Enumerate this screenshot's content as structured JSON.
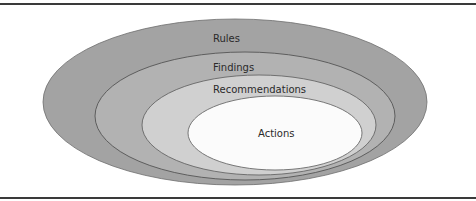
{
  "diagram": {
    "type": "nested-ellipses",
    "layers": [
      {
        "label": "Rules",
        "fill": "#a3a3a3",
        "stroke": "#6e6e6e"
      },
      {
        "label": "Findings",
        "fill": "#b2b2b2",
        "stroke": "#555555"
      },
      {
        "label": "Recommendations",
        "fill": "#d0d0d0",
        "stroke": "#666666"
      },
      {
        "label": "Actions",
        "fill": "#fbfbfb",
        "stroke": "#6a6a6a"
      }
    ]
  }
}
